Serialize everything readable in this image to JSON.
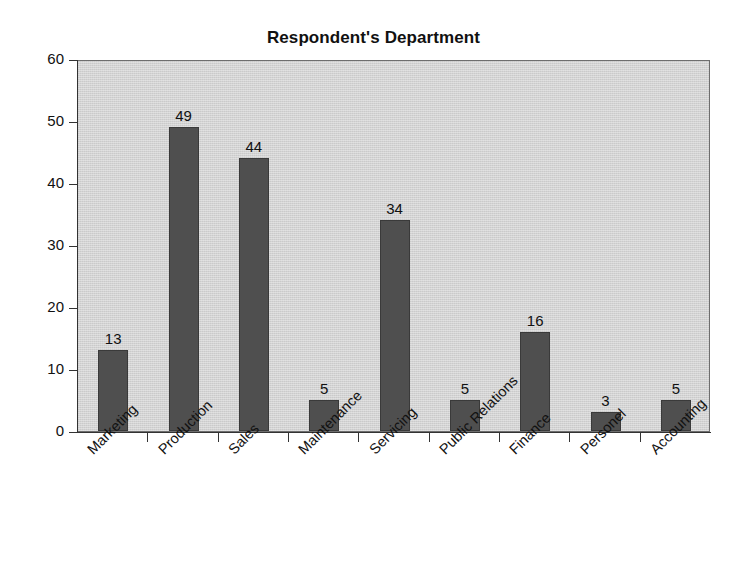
{
  "chart_data": {
    "type": "bar",
    "title": "Respondent's Department",
    "xlabel": "",
    "ylabel": "",
    "categories": [
      "Marketing",
      "Production",
      "Sales",
      "Maintenance",
      "Servicing",
      "Public Relations",
      "Finance",
      "Personel",
      "Accounting"
    ],
    "values": [
      13,
      49,
      44,
      5,
      34,
      5,
      16,
      3,
      5
    ],
    "data_labels": [
      "13",
      "49",
      "44",
      "5",
      "34",
      "5",
      "16",
      "3",
      "5"
    ],
    "ylim": [
      0,
      60
    ],
    "ytick_labels": [
      "0",
      "10",
      "20",
      "30",
      "40",
      "50",
      "60"
    ],
    "ytick_values": [
      0,
      10,
      20,
      30,
      40,
      50,
      60
    ],
    "grid": false,
    "legend": false,
    "legend_position": "none",
    "xtick_label_rotation": -45,
    "colors": {
      "bar_fill": "#4f4f4f",
      "bar_border": "#3a3a3a",
      "plot_background": "#d3d3d3",
      "plot_border": "#6e6e6e",
      "axis": "#333333",
      "text": "#111111",
      "figure_background": "#ffffff"
    }
  }
}
